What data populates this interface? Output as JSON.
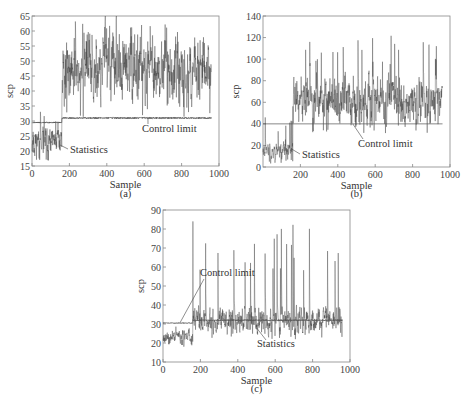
{
  "chart_data": [
    {
      "id": "a",
      "type": "line",
      "caption": "(a)",
      "xlabel": "Sample",
      "ylabel": "scp",
      "xlim": [
        0,
        1000
      ],
      "ylim": [
        15,
        65
      ],
      "xticks": [
        0,
        200,
        400,
        600,
        800,
        1000
      ],
      "xtick_labels": [
        "0",
        "200",
        "400",
        "600",
        "800",
        "1000"
      ],
      "yticks": [
        15,
        20,
        25,
        30,
        35,
        40,
        45,
        50,
        55,
        60,
        65
      ],
      "ytick_labels": [
        "15",
        "20",
        "25",
        "30",
        "35",
        "40",
        "45",
        "50",
        "55",
        "60",
        "65"
      ],
      "grid": false,
      "n_samples": 960,
      "change_point": 160,
      "series": [
        {
          "name": "Statistics",
          "segments": [
            {
              "from": 0,
              "to": 160,
              "mean": 23,
              "spread": 3.5,
              "spike_max": 35
            },
            {
              "from": 160,
              "to": 960,
              "mean": 47,
              "spread": 6.5,
              "spike_max": 64
            }
          ]
        },
        {
          "name": "Control limit",
          "segments": [
            {
              "from": 0,
              "to": 160,
              "mean": 29.5,
              "spread": 0.2
            },
            {
              "from": 160,
              "to": 960,
              "mean": 31,
              "spread": 0.25
            }
          ]
        }
      ],
      "annotations": [
        {
          "text": "Control limit",
          "points_to_x": 620,
          "points_to_y": 31
        },
        {
          "text": "Statistics",
          "points_to_x": 150,
          "points_to_y": 22
        }
      ]
    },
    {
      "id": "b",
      "type": "line",
      "caption": "(b)",
      "xlabel": "Sample",
      "ylabel": "scp",
      "xlim": [
        0,
        1000
      ],
      "ylim": [
        0,
        140
      ],
      "xticks": [
        200,
        400,
        600,
        800,
        1000
      ],
      "xtick_labels": [
        "200",
        "400",
        "600",
        "800",
        "1000"
      ],
      "yticks": [
        0,
        20,
        40,
        60,
        80,
        100,
        120,
        140
      ],
      "ytick_labels": [
        "0",
        "20",
        "40",
        "60",
        "80",
        "100",
        "120",
        "140"
      ],
      "grid": false,
      "n_samples": 960,
      "change_point": 160,
      "series": [
        {
          "name": "Statistics",
          "segments": [
            {
              "from": 0,
              "to": 160,
              "mean": 16,
              "spread": 5,
              "spike_max": 47
            },
            {
              "from": 160,
              "to": 960,
              "mean": 63,
              "spread": 13,
              "spike_max": 122
            }
          ]
        },
        {
          "name": "Control limit",
          "constant": 40
        }
      ],
      "annotations": [
        {
          "text": "Control limit",
          "points_to_x": 480,
          "points_to_y": 40
        },
        {
          "text": "Statistics",
          "points_to_x": 150,
          "points_to_y": 17
        }
      ]
    },
    {
      "id": "c",
      "type": "line",
      "caption": "(c)",
      "xlabel": "Sample",
      "ylabel": "scp",
      "xlim": [
        0,
        1000
      ],
      "ylim": [
        10,
        90
      ],
      "xticks": [
        0,
        200,
        400,
        600,
        800,
        1000
      ],
      "xtick_labels": [
        "0",
        "200",
        "400",
        "600",
        "800",
        "1000"
      ],
      "yticks": [
        10,
        20,
        30,
        40,
        50,
        60,
        70,
        80,
        90
      ],
      "ytick_labels": [
        "10",
        "20",
        "30",
        "40",
        "50",
        "60",
        "70",
        "80",
        "90"
      ],
      "grid": false,
      "n_samples": 960,
      "change_point": 160,
      "series": [
        {
          "name": "Statistics",
          "segments": [
            {
              "from": 0,
              "to": 160,
              "mean": 23,
              "spread": 2,
              "spike_max": 29
            },
            {
              "from": 160,
              "to": 960,
              "mean": 32,
              "spread": 4,
              "spike_max": 84
            }
          ]
        },
        {
          "name": "Control limit",
          "segments": [
            {
              "from": 0,
              "to": 160,
              "mean": 30.5,
              "spread": 0.2
            },
            {
              "from": 160,
              "to": 960,
              "mean": 32,
              "spread": 0.3
            }
          ]
        }
      ],
      "annotations": [
        {
          "text": "Control limit",
          "points_to_x": 90,
          "points_to_y": 30.5
        },
        {
          "text": "Statistics",
          "points_to_x": 500,
          "points_to_y": 28
        }
      ]
    }
  ]
}
